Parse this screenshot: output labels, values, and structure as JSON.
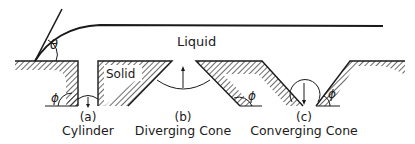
{
  "figure": {
    "labels": {
      "liquid": "Liquid",
      "solid": "Solid",
      "theta": "θ",
      "phi_a": "ϕ",
      "phi_b": "ϕ",
      "phi_c": "ϕ"
    },
    "panels": [
      {
        "tag": "(a)",
        "name": "Cylinder",
        "meniscus_arrow": "down"
      },
      {
        "tag": "(b)",
        "name": "Diverging Cone",
        "meniscus_arrow": "up"
      },
      {
        "tag": "(c)",
        "name": "Converging Cone",
        "meniscus_arrow": "down"
      }
    ],
    "colors": {
      "ink": "#1a1a1a",
      "background": "#ffffff"
    }
  }
}
